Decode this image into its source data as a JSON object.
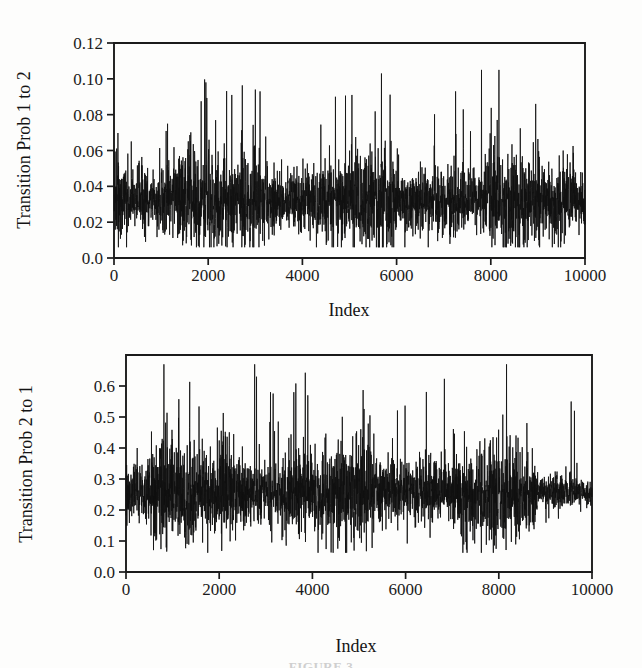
{
  "figure": {
    "caption": "FIGURE 3",
    "background_color": "#fdfdfc",
    "ink_color": "#101010"
  },
  "chart_data": [
    {
      "type": "line",
      "panel": "top",
      "title": "",
      "xlabel": "Index",
      "ylabel": "Transition Prob 1 to 2",
      "xlim": [
        0,
        10000
      ],
      "ylim": [
        0.0,
        0.12
      ],
      "grid": false,
      "legend": "none",
      "xticks": [
        0,
        2000,
        4000,
        6000,
        8000,
        10000
      ],
      "xticklabels": [
        "0",
        "2000",
        "4000",
        "6000",
        "8000",
        "10000"
      ],
      "yticks": [
        0.0,
        0.02,
        0.04,
        0.06,
        0.08,
        0.1,
        0.12
      ],
      "yticklabels": [
        "0.0",
        "0.02",
        "0.04",
        "0.06",
        "0.08",
        "0.10",
        "0.12"
      ],
      "series": [
        {
          "name": "Transition Prob 1 to 2",
          "n_points": 10000,
          "description": "MCMC trace, stationary noisy series",
          "mean": 0.032,
          "sd": 0.012,
          "min": 0.006,
          "max": 0.105,
          "max_index": 7800,
          "notable_peaks": [
            {
              "index": 1950,
              "value": 0.098
            },
            {
              "index": 2500,
              "value": 0.091
            },
            {
              "index": 3000,
              "value": 0.094
            },
            {
              "index": 3100,
              "value": 0.093
            },
            {
              "index": 4700,
              "value": 0.09
            },
            {
              "index": 5050,
              "value": 0.091
            },
            {
              "index": 7250,
              "value": 0.093
            },
            {
              "index": 7800,
              "value": 0.105
            },
            {
              "index": 8950,
              "value": 0.086
            }
          ]
        }
      ]
    },
    {
      "type": "line",
      "panel": "bottom",
      "title": "",
      "xlabel": "Index",
      "ylabel": "Transition Prob 2 to 1",
      "xlim": [
        0,
        10000
      ],
      "ylim": [
        0.0,
        0.7
      ],
      "grid": false,
      "legend": "none",
      "xticks": [
        0,
        2000,
        4000,
        6000,
        8000,
        10000
      ],
      "xticklabels": [
        "0",
        "2000",
        "4000",
        "6000",
        "8000",
        "10000"
      ],
      "yticks": [
        0.0,
        0.1,
        0.2,
        0.3,
        0.4,
        0.5,
        0.6
      ],
      "yticklabels": [
        "0.0",
        "0.1",
        "0.2",
        "0.3",
        "0.4",
        "0.5",
        "0.6"
      ],
      "series": [
        {
          "name": "Transition Prob 2 to 1",
          "n_points": 10000,
          "description": "MCMC trace, stationary noisy series with a dense band near index 9000-10000",
          "mean": 0.255,
          "sd": 0.075,
          "min": 0.062,
          "max": 0.67,
          "max_index": 2760,
          "notable_peaks": [
            {
              "index": 2760,
              "value": 0.67
            },
            {
              "index": 2800,
              "value": 0.63
            },
            {
              "index": 3100,
              "value": 0.58
            },
            {
              "index": 3600,
              "value": 0.58
            },
            {
              "index": 3900,
              "value": 0.57
            },
            {
              "index": 9550,
              "value": 0.55
            },
            {
              "index": 9620,
              "value": 0.52
            }
          ]
        }
      ]
    }
  ]
}
